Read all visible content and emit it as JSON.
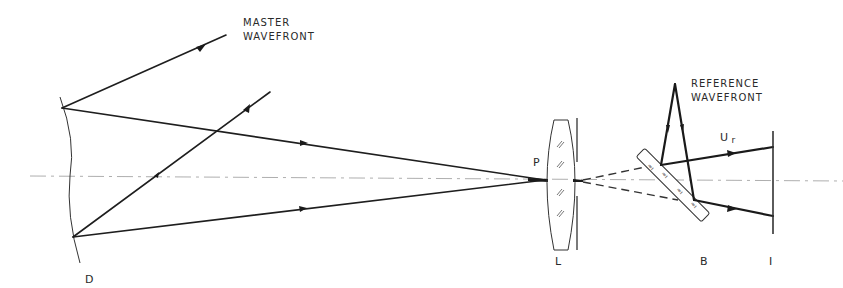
{
  "figure": {
    "type": "optical-setup-schematic",
    "labels": {
      "master_wavefront_line1": "MASTER",
      "master_wavefront_line2": "WAVEFRONT",
      "reference_wavefront_line1": "REFERENCE",
      "reference_wavefront_line2": "WAVEFRONT",
      "mirror": "D",
      "focus_point": "P",
      "lens": "L",
      "beam_splitter": "B",
      "image_plane": "I",
      "reference_field": "U",
      "reference_field_subscript": "r"
    },
    "colors": {
      "background": "#ffffff",
      "ink": "#1e1e1e",
      "axis": "#999999"
    }
  }
}
